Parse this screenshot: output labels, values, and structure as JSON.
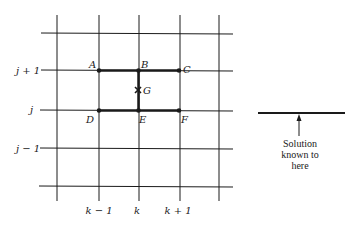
{
  "diagram": {
    "type": "finite-difference-grid",
    "row_labels": [
      "j + 1",
      "j",
      "j − 1"
    ],
    "column_labels": [
      "k − 1",
      "k",
      "k + 1"
    ],
    "points": {
      "A": "A",
      "B": "B",
      "C": "C",
      "D": "D",
      "E": "E",
      "F": "F",
      "G": "G"
    },
    "legend": {
      "line1": "Solution",
      "line2": "known to",
      "line3": "here"
    },
    "colors": {
      "ink": "#1a1a1a",
      "background": "#ffffff"
    }
  }
}
